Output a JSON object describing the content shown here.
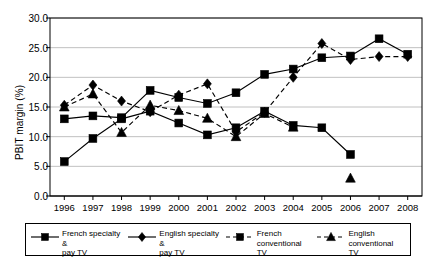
{
  "chart_data": {
    "type": "line",
    "title": "",
    "xlabel": "",
    "ylabel": "PBIT margin (%)",
    "ylim": [
      0.0,
      30.0
    ],
    "yticks": [
      "0.0",
      "5.0",
      "10.0",
      "15.0",
      "20.0",
      "25.0",
      "30.0"
    ],
    "ytick_values": [
      0.0,
      5.0,
      10.0,
      15.0,
      20.0,
      25.0,
      30.0
    ],
    "grid": true,
    "legend_position": "bottom",
    "categories": [
      1996,
      1997,
      1998,
      1999,
      2000,
      2001,
      2002,
      2003,
      2004,
      2005,
      2006,
      2007,
      2008
    ],
    "xtick_labels": [
      "1996",
      "1997",
      "1998",
      "1999",
      "2000",
      "2001",
      "2002",
      "2003",
      "2004",
      "2005",
      "2006",
      "2007",
      "2008"
    ],
    "series": [
      {
        "name": "French specialty & pay TV",
        "marker": "square",
        "line": "solid",
        "values": [
          5.8,
          9.7,
          13.0,
          14.3,
          12.3,
          10.3,
          11.5,
          14.3,
          11.9,
          11.5,
          7.0,
          null,
          null
        ]
      },
      {
        "name": "English specialty & pay TV",
        "marker": "diamond",
        "line": "dashed",
        "values": [
          15.3,
          18.7,
          16.0,
          14.2,
          17.0,
          18.9,
          10.8,
          14.1,
          20.0,
          25.7,
          23.0,
          23.5,
          23.5
        ]
      },
      {
        "name": "French conventional TV",
        "marker": "square",
        "line": "solid",
        "values": [
          13.0,
          13.5,
          13.2,
          17.8,
          16.6,
          15.6,
          17.4,
          20.5,
          21.4,
          23.3,
          23.6,
          26.5,
          23.9
        ]
      },
      {
        "name": "English conventional TV",
        "marker": "triangle",
        "line": "dashed",
        "values": [
          15.0,
          17.2,
          10.7,
          15.3,
          14.4,
          13.1,
          10.0,
          13.9,
          11.6,
          null,
          3.0,
          null,
          null
        ]
      }
    ]
  },
  "legend": {
    "items": [
      {
        "label": "French specialty &\npay TV",
        "marker": "square",
        "line": "solid",
        "name": "legend-french-specialty"
      },
      {
        "label": "English specialty &\npay TV",
        "marker": "diamond",
        "line": "solid",
        "name": "legend-english-specialty"
      },
      {
        "label": "French conventional\nTV",
        "marker": "square",
        "line": "dashed",
        "name": "legend-french-conventional"
      },
      {
        "label": "English conventional\nTV",
        "marker": "triangle",
        "line": "dashed",
        "name": "legend-english-conventional"
      }
    ]
  },
  "colors": {
    "ink": "#000000",
    "grid": "#b0b0b0",
    "background": "#ffffff"
  }
}
